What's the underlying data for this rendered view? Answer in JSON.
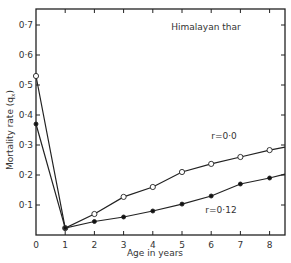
{
  "chart_data": {
    "type": "line",
    "title": "Himalayan thar",
    "xlabel": "Age in years",
    "ylabel": "Mortality rate (qx)",
    "xlim": [
      0,
      8.6
    ],
    "ylim": [
      0,
      0.75
    ],
    "x_ticks": [
      "0",
      "1",
      "2",
      "3",
      "4",
      "5",
      "6",
      "7",
      "8"
    ],
    "y_ticks": [
      "0.1",
      "0.2",
      "0.3",
      "0.4",
      "0.5",
      "0.6",
      "0.7"
    ],
    "y_tick_labels": [
      "0·1",
      "0·2",
      "0·3",
      "0·4",
      "0·5",
      "0·6",
      "0·7"
    ],
    "grid": false,
    "x": [
      0,
      1,
      2,
      3,
      4,
      5,
      6,
      7,
      8
    ],
    "series": [
      {
        "name": "r=0.0",
        "label": "r=0·0",
        "marker": "open-circle",
        "values": [
          0.53,
          0.023,
          0.07,
          0.127,
          0.16,
          0.21,
          0.237,
          0.26,
          0.283
        ],
        "end_value": 0.293
      },
      {
        "name": "r=0.12",
        "label": "r=0·12",
        "marker": "filled-circle",
        "values": [
          0.37,
          0.023,
          0.045,
          0.06,
          0.08,
          0.103,
          0.13,
          0.17,
          0.19
        ],
        "end_value": 0.203
      }
    ],
    "annotations": [
      "Himalayan thar",
      "r=0·0",
      "r=0·12"
    ]
  },
  "labels": {
    "title": "Himalayan thar",
    "xlabel": "Age in years",
    "ylabel": "Mortality rate (q",
    "ylabel_sub": "x",
    "ylabel_close": ")",
    "series0": "r=0·0",
    "series1": "r=0·12"
  }
}
